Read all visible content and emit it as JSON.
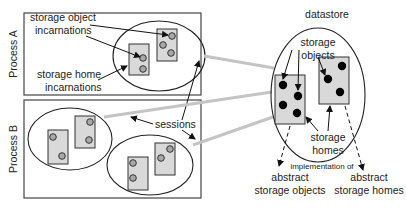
{
  "diagram": {
    "processes": [
      {
        "label": "Process A"
      },
      {
        "label": "Process B"
      }
    ],
    "datastore": {
      "label": "datastore"
    },
    "labels": {
      "storage_object_incarnations_1": "storage object",
      "storage_object_incarnations_2": "incarnations",
      "storage_home_incarnations_1": "storage home",
      "storage_home_incarnations_2": "incarnations",
      "sessions": "sessions",
      "storage_objects_1": "storage",
      "storage_objects_2": "objects",
      "storage_homes_1": "storage",
      "storage_homes_2": "homes",
      "implementation_of": "implementation of",
      "abstract_storage_objects_1": "abstract",
      "abstract_storage_objects_2": "storage objects",
      "abstract_storage_homes_1": "abstract",
      "abstract_storage_homes_2": "storage homes"
    },
    "colors": {
      "session_line": "#c4c4c4",
      "rect_fill": "#d9d9d9",
      "incarnation_fill": "#a8a8a8",
      "object_fill": "#000000"
    }
  }
}
